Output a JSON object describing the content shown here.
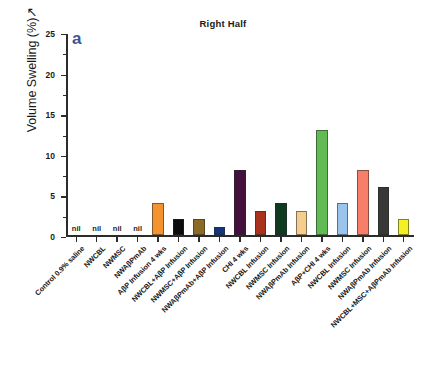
{
  "chart_data": {
    "type": "bar",
    "title": "Right Half",
    "panel_label": "a",
    "xlabel": "",
    "ylabel": "Volume Swelling (%)",
    "ylabel_suffix": "↗",
    "ylim": [
      0,
      25
    ],
    "yticks": [
      0,
      5,
      10,
      15,
      20,
      25
    ],
    "ytick_labels": [
      "0",
      "5",
      "10",
      "15",
      "20",
      "25"
    ],
    "grid": false,
    "legend": "none",
    "nil_marker": "nil",
    "categories": [
      "Control 0.9% saline",
      "NWCBL",
      "NWMSC",
      "NWAβPmAb",
      "AβP Infusion 4 wks",
      "NWCBL+AβP Infusion",
      "NWMSC+AβP Infusion",
      "NWAβPmAb+AβP Infusion",
      "CHI 4 wks",
      "NWCBL Infusion",
      "NWMSC Infusion",
      "NWAβPmAb Infusion",
      "AβP+CHI 4 wks",
      "NWCBL Infusion",
      "NWMSC Infusion",
      "NWAβPmAb Infusion",
      "NWCBL+MSC+AβPmAb Infusion"
    ],
    "values": [
      0,
      0,
      0,
      0,
      4,
      2,
      2,
      1,
      8,
      3,
      4,
      3,
      13,
      4,
      8,
      6,
      2
    ],
    "value_is_nil": [
      true,
      true,
      true,
      true,
      false,
      false,
      false,
      false,
      false,
      false,
      false,
      false,
      false,
      false,
      false,
      false,
      false
    ],
    "colors": [
      "#ffffff",
      "#ffffff",
      "#ffffff",
      "#ffffff",
      "#f29330",
      "#0c0c0c",
      "#8a6a24",
      "#13357f",
      "#44103c",
      "#a9321d",
      "#103a20",
      "#f5cd8c",
      "#61bb55",
      "#9ac4ec",
      "#f77f6a",
      "#383838",
      "#f4f024"
    ]
  },
  "style": {
    "title_color": "#1a1a1a",
    "panel_label_color": "#3b5598",
    "axis_color": "#2b2b2b",
    "background": "#ffffff"
  }
}
